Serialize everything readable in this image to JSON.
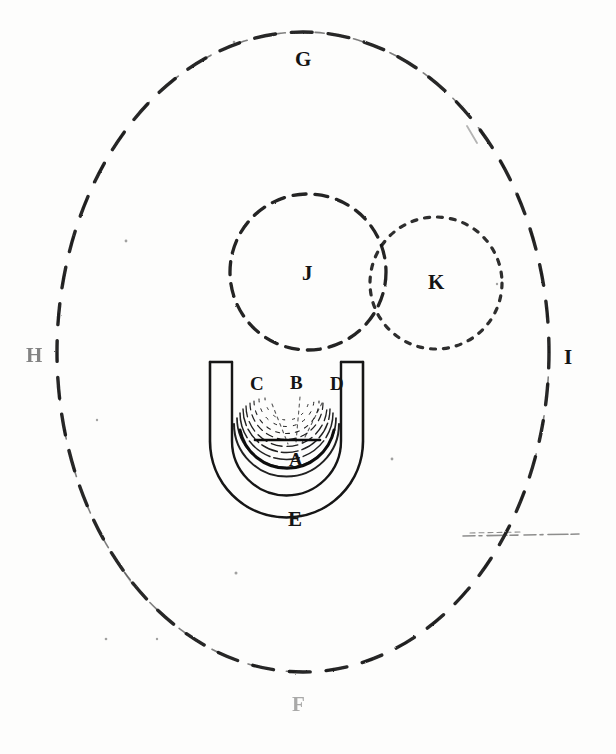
{
  "figure": {
    "kind": "antique-scientific-diagram",
    "background_color": "#fdfdfc",
    "ink_color": "#141414",
    "labels": {
      "outer_top": "G",
      "outer_left": "H",
      "outer_right": "I",
      "outer_bottom": "F",
      "circle_left": "J",
      "circle_right": "K",
      "vessel_left_region": "C",
      "vessel_center_region": "B",
      "vessel_right_region": "D",
      "vessel_focus": "A",
      "vessel_bottom": "E"
    },
    "elements": {
      "outer_ellipse": {
        "name": "outer-dashed-ellipse",
        "cx": 303,
        "cy": 352,
        "rx": 246,
        "ry": 320,
        "stroke_style": "dashed",
        "stroke_width": 3
      },
      "circle_j": {
        "name": "dashed-circle-j",
        "cx": 308,
        "cy": 272,
        "r": 78,
        "stroke_style": "dashed",
        "stroke_width": 3
      },
      "circle_k": {
        "name": "dotted-circle-k",
        "cx": 436,
        "cy": 283,
        "r": 66,
        "stroke_style": "dotted",
        "stroke_width": 3
      },
      "vessel": {
        "name": "u-shaped-vessel",
        "left_arm_x": 210,
        "right_arm_x": 363,
        "top_y": 361,
        "bottom_y": 500,
        "wall_thickness": 12,
        "arc_count": 8
      },
      "scan_artifact_line": {
        "name": "scan-artifact-line",
        "x1": 463,
        "x2": 582,
        "y": 535
      }
    }
  }
}
